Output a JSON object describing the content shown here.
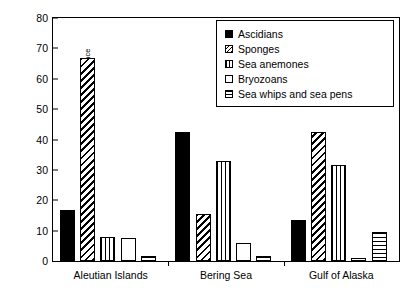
{
  "chart_data": {
    "type": "bar",
    "title": "",
    "xlabel": "",
    "ylabel": "Percentage of occurrence",
    "ylim": [
      0,
      80
    ],
    "yticks": [
      0,
      10,
      20,
      30,
      40,
      50,
      60,
      70,
      80
    ],
    "grid": false,
    "legend_position": "top-right",
    "categories": [
      "Aleutian Islands",
      "Bering Sea",
      "Gulf of Alaska"
    ],
    "series": [
      {
        "name": "Ascidians",
        "pattern": "solid",
        "values": [
          16.7,
          42.5,
          13.5
        ]
      },
      {
        "name": "Sponges",
        "pattern": "diag",
        "values": [
          67.0,
          15.5,
          42.5
        ]
      },
      {
        "name": "Sea anemones",
        "pattern": "vert",
        "values": [
          8.0,
          33.0,
          31.5
        ]
      },
      {
        "name": "Bryozoans",
        "pattern": "empty",
        "values": [
          7.5,
          6.0,
          1.0
        ]
      },
      {
        "name": "Sea whips and sea pens",
        "pattern": "horiz",
        "values": [
          1.5,
          1.5,
          9.5
        ]
      }
    ]
  }
}
